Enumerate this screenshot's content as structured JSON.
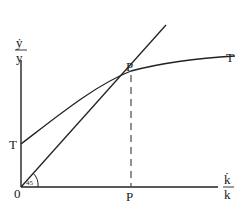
{
  "diagram": {
    "type": "growth-diagram",
    "y_axis_label": {
      "numerator": "ẏ",
      "denominator": "y"
    },
    "x_axis_label": {
      "numerator": "k̇",
      "denominator": "k"
    },
    "origin_label": "0",
    "angle_label": "45",
    "curve_T": {
      "start_label": "T",
      "end_label": "T"
    },
    "intersection_label": "P",
    "x_foot_label": "P"
  }
}
